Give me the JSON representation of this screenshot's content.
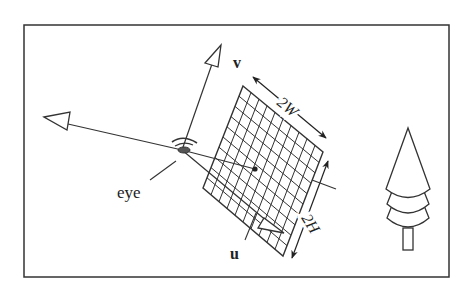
{
  "diagram": {
    "type": "camera-view-plane",
    "labels": {
      "eye": "eye",
      "v": "v",
      "u": "u",
      "width": "2W",
      "height": "2H"
    },
    "elements": [
      "frame",
      "eye",
      "view-plane-grid",
      "v-axis-arrow",
      "u-axis-arrow",
      "backward-axis-arrow",
      "eye-to-center-line",
      "center-point",
      "width-dimension-arrow",
      "height-dimension-arrow",
      "tree"
    ],
    "colors": {
      "stroke": "#2a2a2a",
      "background": "#ffffff"
    }
  }
}
